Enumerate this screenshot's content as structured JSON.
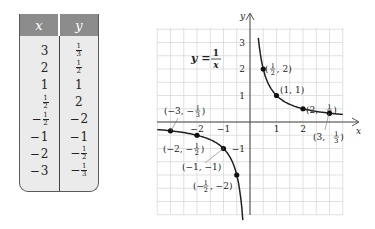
{
  "table": {
    "headers": [
      "x",
      "y"
    ],
    "rows": [
      {
        "x": "3",
        "y": "1/3"
      },
      {
        "x": "2",
        "y": "1/2"
      },
      {
        "x": "1",
        "y": "1"
      },
      {
        "x": "1/2",
        "y": "2"
      },
      {
        "x": "-1/2",
        "y": "-2"
      },
      {
        "x": "-1",
        "y": "-1"
      },
      {
        "x": "-2",
        "y": "-1/2"
      },
      {
        "x": "-3",
        "y": "-1/3"
      }
    ],
    "colors": {
      "header_bg": "#8c8c8c",
      "body_bg": "#ebebeb",
      "border": "#5a5a5a"
    }
  },
  "chart_data": {
    "type": "line",
    "equation_label": {
      "lhs": "y",
      "num": "1",
      "den": "x"
    },
    "xlabel": "x",
    "ylabel": "y",
    "xlim": [
      -3.5,
      3.5
    ],
    "ylim": [
      -3.5,
      3.5
    ],
    "grid": true,
    "grid_step": 0.5,
    "x_ticks": [
      -2,
      -1,
      1,
      2
    ],
    "y_ticks": [
      -1,
      1,
      2,
      3
    ],
    "series": [
      {
        "name": "y = 1/x",
        "function": "1/x"
      }
    ],
    "points": [
      {
        "x": -3,
        "y": -0.3333,
        "label": "(−3, −1/3)"
      },
      {
        "x": -2,
        "y": -0.5,
        "label": "(−2, −1/2)"
      },
      {
        "x": -1,
        "y": -1,
        "label": "(−1, −1)"
      },
      {
        "x": -0.5,
        "y": -2,
        "label": "(−1/2, −2)"
      },
      {
        "x": 0.5,
        "y": 2,
        "label": "(1/2, 2)"
      },
      {
        "x": 1,
        "y": 1,
        "label": "(1, 1)"
      },
      {
        "x": 2,
        "y": 0.5,
        "label": "(2, 1/2)"
      },
      {
        "x": 3,
        "y": 0.3333,
        "label": "(3, 1/3)"
      }
    ],
    "colors": {
      "curve": "#222222",
      "grid": "#d9d9d9",
      "axis": "#444444"
    }
  }
}
